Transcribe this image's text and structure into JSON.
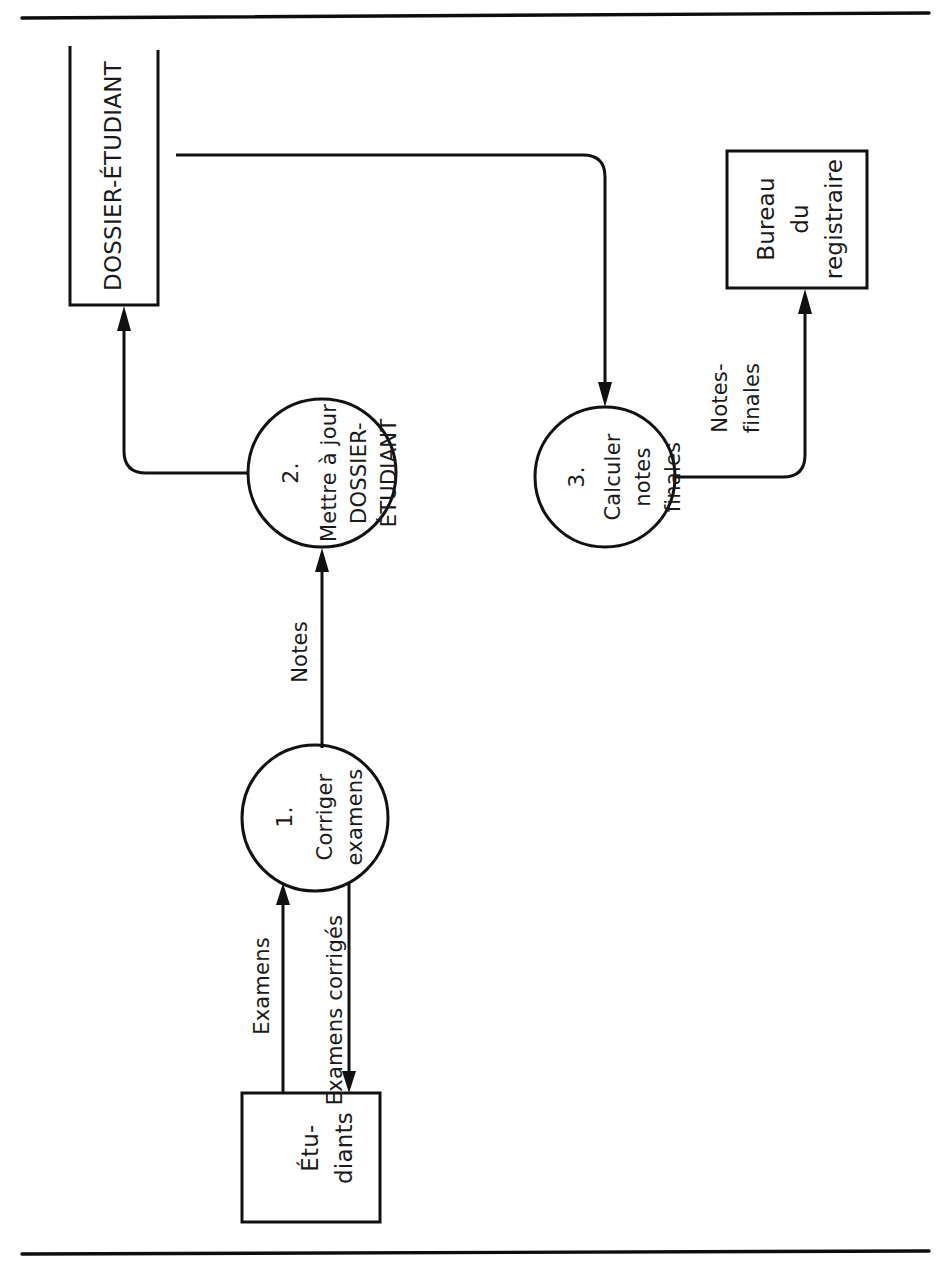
{
  "page": {
    "orientation": "landscape-rotated",
    "background_color": "#ffffff",
    "ink_color": "#111111"
  },
  "rules": {
    "top_rule": "horizontal-rule-top",
    "bottom_rule": "horizontal-rule-bottom"
  },
  "data_stores": [
    {
      "id": "D1",
      "label": "DOSSIER-ÉTUDIANT",
      "notation": "open-ended-rectangle"
    }
  ],
  "external_entities": [
    {
      "id": "E1",
      "label_lines": [
        "Étu-",
        "diants"
      ],
      "label": "Étu-diants"
    },
    {
      "id": "E2",
      "label_lines": [
        "Bureau",
        "du",
        "registraire"
      ],
      "label": "Bureau du registraire"
    }
  ],
  "processes": [
    {
      "id": "P1",
      "number": "1.",
      "label_lines": [
        "Corriger",
        "examens"
      ],
      "label": "Corriger examens"
    },
    {
      "id": "P2",
      "number": "2.",
      "label_lines": [
        "Mettre à jour",
        "DOSSIER-",
        "ÉTUDIANT"
      ],
      "label": "Mettre à jour DOSSIER-ÉTUDIANT"
    },
    {
      "id": "P3",
      "number": "3.",
      "label_lines": [
        "Calculer",
        "notes",
        "finales"
      ],
      "label": "Calculer notes finales"
    }
  ],
  "data_flows": [
    {
      "id": "F1",
      "label": "Examens",
      "from": "E1",
      "to": "P1"
    },
    {
      "id": "F2",
      "label": "Examens corrigés",
      "from": "P1",
      "to": "E1"
    },
    {
      "id": "F3",
      "label": "Notes",
      "from": "P1",
      "to": "P2"
    },
    {
      "id": "F4",
      "label": "",
      "from": "P2",
      "to": "D1"
    },
    {
      "id": "F5",
      "label": "",
      "from": "D1",
      "to": "P3"
    },
    {
      "id": "F6",
      "label_lines": [
        "Notes-",
        "finales"
      ],
      "label": "Notes-finales",
      "from": "P3",
      "to": "E2"
    }
  ]
}
